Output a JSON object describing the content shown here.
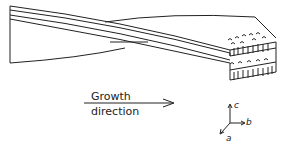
{
  "diagram": {
    "growth_label_line1": "Growth",
    "growth_label_line2": "direction",
    "axes": {
      "a": "a",
      "b": "b",
      "c": "c"
    },
    "stroke_color": "#222222",
    "background": "#ffffff"
  }
}
